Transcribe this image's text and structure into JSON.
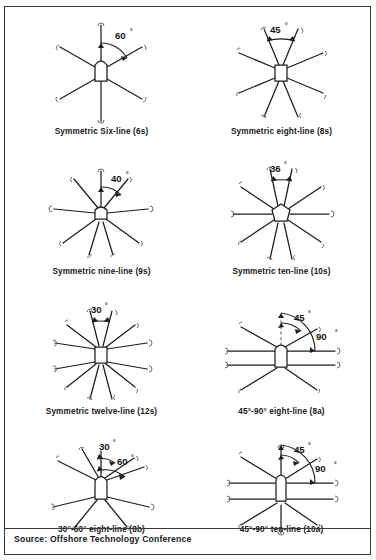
{
  "figure": {
    "source_label": "Source: Offshore Technology Conference",
    "frame_color": "#3a3a3a",
    "ink_color": "#161616",
    "background": "#ffffff"
  },
  "panels": [
    {
      "id": "6s",
      "caption": "Symmetric Six-line (6s)",
      "angle_labels": [
        "60"
      ],
      "degree_symbol": "°",
      "line_count": 6,
      "spacing_degrees": 60,
      "type": "symmetric",
      "hub": "rounded-rect"
    },
    {
      "id": "8s",
      "caption": "Symmetric eight-line (8s)",
      "angle_labels": [
        "45"
      ],
      "degree_symbol": "°",
      "line_count": 8,
      "spacing_degrees": 45,
      "type": "symmetric",
      "hub": "rounded-rect"
    },
    {
      "id": "9s",
      "caption": "Symmetric nine-line (9s)",
      "angle_labels": [
        "40"
      ],
      "degree_symbol": "°",
      "line_count": 9,
      "spacing_degrees": 40,
      "type": "symmetric",
      "hub": "rounded-rect"
    },
    {
      "id": "10s",
      "caption": "Symmetric ten-line (10s)",
      "angle_labels": [
        "36"
      ],
      "degree_symbol": "°",
      "line_count": 10,
      "spacing_degrees": 36,
      "type": "symmetric",
      "hub": "pentagon"
    },
    {
      "id": "12s",
      "caption": "Symmetric twelve-line (12s)",
      "angle_labels": [
        "30"
      ],
      "degree_symbol": "°",
      "line_count": 12,
      "spacing_degrees": 30,
      "type": "symmetric",
      "hub": "rounded-rect"
    },
    {
      "id": "8a",
      "caption": "45°-90° eight-line (8a)",
      "angle_labels": [
        "45",
        "90"
      ],
      "degree_symbol": "°",
      "line_count": 8,
      "spacing_degrees": 45,
      "type": "asymmetric",
      "hub": "rounded-rect"
    },
    {
      "id": "8b",
      "caption": "30°-60° eight-line (8b)",
      "angle_labels": [
        "30",
        "60"
      ],
      "degree_symbol": "°",
      "line_count": 8,
      "spacing_degrees": 30,
      "type": "asymmetric",
      "hub": "rounded-rect"
    },
    {
      "id": "10a",
      "caption": "45°-90° ten-line (10a)",
      "angle_labels": [
        "45",
        "90"
      ],
      "degree_symbol": "°",
      "line_count": 10,
      "spacing_degrees": 45,
      "type": "asymmetric",
      "hub": "rounded-rect"
    }
  ]
}
